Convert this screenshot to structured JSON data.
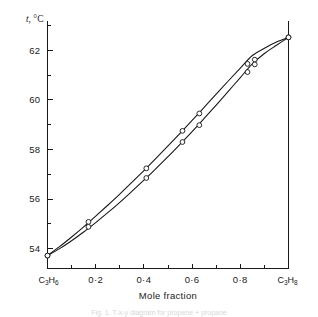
{
  "figure": {
    "background": "#ffffff",
    "ink_color": "#141414",
    "caption_partial": "Fig. 1. T-x-y diagram for propene + propane"
  },
  "chart_data": {
    "type": "line",
    "title": "",
    "xlabel": "Mole fraction",
    "ylabel": "t, °C",
    "ylabel_symbol": "t",
    "ylabel_unit": "°C",
    "xlim": [
      0,
      1
    ],
    "ylim": [
      53.2,
      63.2
    ],
    "grid": false,
    "legend": false,
    "x_axis": {
      "left_end_label": "C3H6",
      "left_end_label_formula": [
        "C",
        "3",
        "H",
        "6"
      ],
      "right_end_label": "C3H8",
      "right_end_label_formula": [
        "C",
        "3",
        "H",
        "8"
      ],
      "major_ticks": [
        0.2,
        0.4,
        0.6,
        0.8
      ],
      "major_tick_labels": [
        "0·2",
        "0·4",
        "0·6",
        "0·8"
      ],
      "minor_ticks": [
        0.1,
        0.3,
        0.5,
        0.7,
        0.9
      ]
    },
    "y_axis": {
      "major_ticks": [
        54,
        56,
        58,
        60,
        62
      ],
      "major_tick_labels": [
        "54",
        "56",
        "58",
        "60",
        "62"
      ],
      "minor_ticks": [
        55,
        57,
        59,
        61,
        63
      ]
    },
    "series": [
      {
        "name": "dew curve (vapour)",
        "marker": "open-circle",
        "x": [
          0.0,
          0.05,
          0.1,
          0.15,
          0.2,
          0.25,
          0.3,
          0.35,
          0.4,
          0.45,
          0.5,
          0.55,
          0.6,
          0.65,
          0.7,
          0.75,
          0.8,
          0.85,
          0.9,
          0.95,
          1.0
        ],
        "y": [
          53.72,
          54.08,
          54.47,
          54.88,
          55.31,
          55.75,
          56.2,
          56.67,
          57.15,
          57.64,
          58.14,
          58.65,
          59.17,
          59.7,
          60.23,
          60.76,
          61.28,
          61.79,
          62.08,
          62.33,
          62.52
        ],
        "data_points": [
          {
            "x": 0.0,
            "y": 53.72
          },
          {
            "x": 0.17,
            "y": 55.08
          },
          {
            "x": 0.41,
            "y": 57.24
          },
          {
            "x": 0.56,
            "y": 58.75
          },
          {
            "x": 0.63,
            "y": 59.45
          },
          {
            "x": 0.83,
            "y": 61.45
          },
          {
            "x": 0.86,
            "y": 61.62
          },
          {
            "x": 1.0,
            "y": 62.52
          }
        ]
      },
      {
        "name": "bubble curve (liquid)",
        "marker": "open-circle",
        "x": [
          0.0,
          0.05,
          0.1,
          0.15,
          0.2,
          0.25,
          0.3,
          0.35,
          0.4,
          0.45,
          0.5,
          0.55,
          0.6,
          0.65,
          0.7,
          0.75,
          0.8,
          0.85,
          0.9,
          0.95,
          1.0
        ],
        "y": [
          53.72,
          54.0,
          54.32,
          54.67,
          55.05,
          55.45,
          55.87,
          56.31,
          56.76,
          57.23,
          57.71,
          58.21,
          58.72,
          59.25,
          59.79,
          60.34,
          60.9,
          61.45,
          61.87,
          62.2,
          62.52
        ],
        "data_points": [
          {
            "x": 0.0,
            "y": 53.72
          },
          {
            "x": 0.17,
            "y": 54.88
          },
          {
            "x": 0.41,
            "y": 56.85
          },
          {
            "x": 0.56,
            "y": 58.3
          },
          {
            "x": 0.63,
            "y": 58.98
          },
          {
            "x": 0.83,
            "y": 61.12
          },
          {
            "x": 0.86,
            "y": 61.43
          },
          {
            "x": 1.0,
            "y": 62.52
          }
        ]
      }
    ]
  }
}
